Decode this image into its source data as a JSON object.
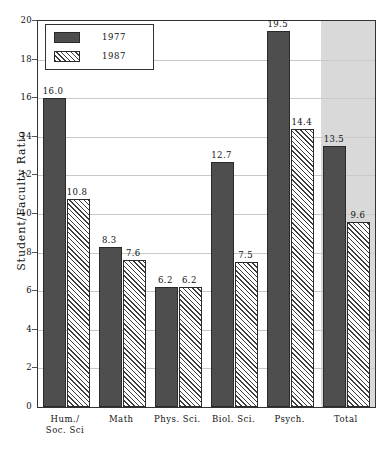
{
  "chart_data": {
    "type": "bar",
    "title": "",
    "xlabel": "",
    "ylabel": "Student/Faculty Ratio",
    "ylim": [
      0,
      20
    ],
    "ytick_step": 2,
    "yticks": [
      0,
      2,
      4,
      6,
      8,
      10,
      12,
      14,
      16,
      18,
      20
    ],
    "ytick_labels": [
      "0",
      "2",
      "4",
      "6",
      "8",
      "10",
      "12",
      "14",
      "16",
      "18",
      "20"
    ],
    "grid": true,
    "grid_axis": "y",
    "legend_position": "upper left",
    "categories": [
      "Hum./\nSoc. Sci",
      "Math",
      "Phys. Sci.",
      "Biol. Sci.",
      "Psych.",
      "Total"
    ],
    "series": [
      {
        "name": "1977",
        "style": "solid",
        "color": "#4e4e4e",
        "values": [
          16.0,
          8.3,
          6.2,
          12.7,
          19.5,
          13.5
        ],
        "value_labels": [
          "16.0",
          "8.3",
          "6.2",
          "12.7",
          "19.5",
          "13.5"
        ]
      },
      {
        "name": "1987",
        "style": "hatched",
        "color": "#ffffff",
        "values": [
          10.8,
          7.6,
          6.2,
          7.5,
          14.4,
          9.6
        ],
        "value_labels": [
          "10.8",
          "7.6",
          "6.2",
          "7.5",
          "14.4",
          "9.6"
        ]
      }
    ],
    "highlighted_category": "Total",
    "highlight_color": "#d9d9d9",
    "frame_color": "#333333",
    "gridline_color": "#c9c9c9"
  },
  "legend": {
    "entries": [
      {
        "label": "1977"
      },
      {
        "label": "1987"
      }
    ]
  },
  "caption": ""
}
